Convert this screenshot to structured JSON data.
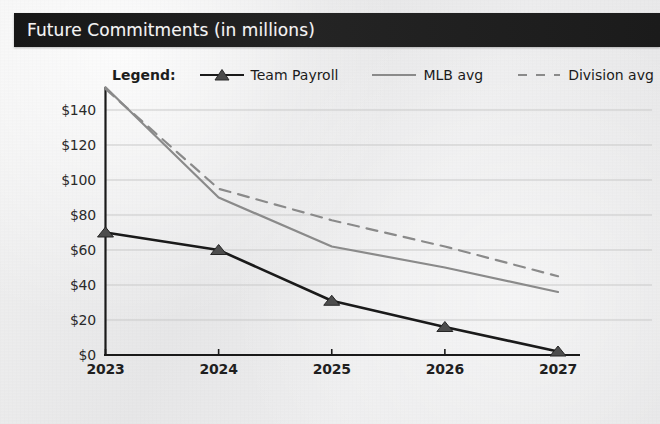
{
  "header": {
    "title": "Future Commitments (in millions)",
    "background_color": "#1f1f1f",
    "text_color": "#f4f4f4"
  },
  "legend": {
    "label": "Legend:",
    "items": [
      {
        "name": "Team Payroll",
        "style": "solid-with-triangle-marker",
        "color": "#1a1a1a"
      },
      {
        "name": "MLB avg",
        "style": "solid",
        "color": "#8a8a8a"
      },
      {
        "name": "Division avg",
        "style": "dashed",
        "color": "#8a8a8a"
      }
    ]
  },
  "chart_data": {
    "type": "line",
    "title": "Future Commitments (in millions)",
    "xlabel": "",
    "ylabel": "",
    "categories": [
      "2023",
      "2024",
      "2025",
      "2026",
      "2027"
    ],
    "x": [
      2023,
      2024,
      2025,
      2026,
      2027
    ],
    "series": [
      {
        "name": "Team Payroll",
        "values": [
          70,
          60,
          31,
          16,
          2
        ],
        "color": "#1a1a1a",
        "style": "solid",
        "marker": "triangle"
      },
      {
        "name": "MLB avg",
        "values": [
          153,
          90,
          62,
          50,
          36
        ],
        "color": "#8a8a8a",
        "style": "solid",
        "marker": "none"
      },
      {
        "name": "Division avg",
        "values": [
          152,
          95,
          77,
          62,
          45
        ],
        "color": "#8a8a8a",
        "style": "dashed",
        "marker": "none"
      }
    ],
    "ylim": [
      0,
      150
    ],
    "yticks": [
      0,
      20,
      40,
      60,
      80,
      100,
      120,
      140
    ],
    "ytick_labels": [
      "$0",
      "$20",
      "$40",
      "$60",
      "$80",
      "$100",
      "$120",
      "$140"
    ],
    "xtick_labels": [
      "2023",
      "2024",
      "2025",
      "2026",
      "2027"
    ],
    "grid": true,
    "grid_axis": "y",
    "legend_position": "top"
  },
  "colors": {
    "page_background": "#ebebeb",
    "axis": "#1a1a1a",
    "gridline": "#c9c9c9",
    "accent_dark": "#1a1a1a",
    "accent_gray": "#8a8a8a"
  }
}
